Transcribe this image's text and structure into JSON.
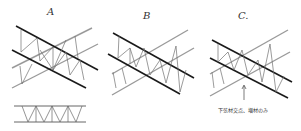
{
  "figure": {
    "panels": [
      {
        "id": "A",
        "label": "A"
      },
      {
        "id": "B",
        "label": "B"
      },
      {
        "id": "C",
        "label": "C."
      }
    ],
    "annotation": "下弦材交点、増材のみ",
    "colors": {
      "dark_chord": "#1a1a1a",
      "light_chord": "#9a9a9a",
      "web": "#707070"
    }
  }
}
